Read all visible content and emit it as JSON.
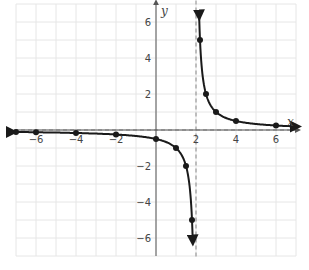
{
  "chart_data": {
    "type": "line",
    "title": "",
    "function": "y = 1/(x - 2)",
    "xlabel": "x",
    "ylabel": "y",
    "xlim": [
      -7,
      7
    ],
    "ylim": [
      -7,
      7
    ],
    "grid": true,
    "x_ticks": [
      -6,
      -4,
      -2,
      2,
      4,
      6
    ],
    "y_ticks": [
      6,
      4,
      2,
      -2,
      -4,
      -6
    ],
    "x_tick_labels": [
      "−6",
      "−4",
      "−2",
      "2",
      "4",
      "6"
    ],
    "y_tick_labels": [
      "6",
      "4",
      "2",
      "−2",
      "−4",
      "−6"
    ],
    "asymptotes": {
      "vertical": 2,
      "horizontal": 0
    },
    "series": [
      {
        "name": "left branch",
        "points": [
          {
            "x": -7,
            "y": -0.111
          },
          {
            "x": -6,
            "y": -0.125
          },
          {
            "x": -4,
            "y": -0.167
          },
          {
            "x": -2,
            "y": -0.25
          },
          {
            "x": 0,
            "y": -0.5
          },
          {
            "x": 1,
            "y": -1
          },
          {
            "x": 1.5,
            "y": -2
          },
          {
            "x": 1.8,
            "y": -5
          }
        ]
      },
      {
        "name": "right branch",
        "points": [
          {
            "x": 2.2,
            "y": 5
          },
          {
            "x": 2.5,
            "y": 2
          },
          {
            "x": 3,
            "y": 1
          },
          {
            "x": 4,
            "y": 0.5
          },
          {
            "x": 6,
            "y": 0.25
          }
        ]
      }
    ],
    "colors": {
      "curve": "#1a1a1a",
      "grid": "#e6e6e6",
      "axis": "#555555",
      "asymptote": "#9a9a9a"
    }
  }
}
